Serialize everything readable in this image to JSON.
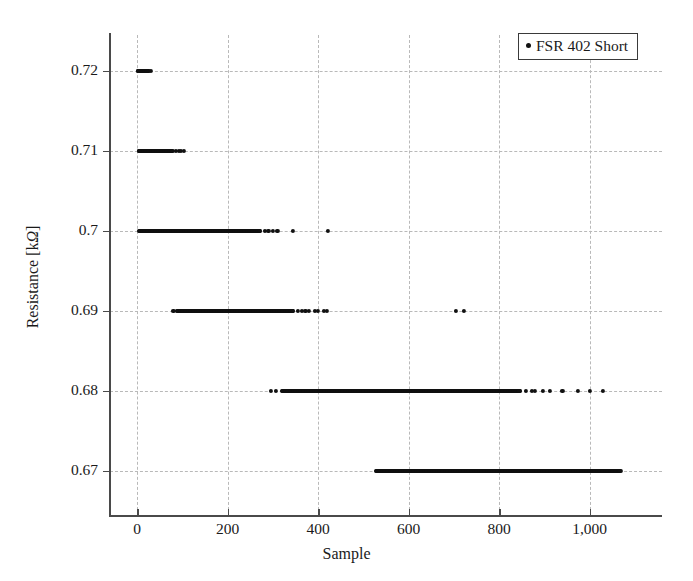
{
  "chart_data": {
    "type": "scatter",
    "title": "",
    "xlabel": "Sample",
    "ylabel": "Resistance [kΩ]",
    "ylabel_text": "Resistance [k",
    "ylabel_unit": "Ω",
    "ylabel_tail": "]",
    "xlim": [
      -60,
      1160
    ],
    "ylim": [
      0.6645,
      0.7245
    ],
    "grid": true,
    "legend_position": "top-right",
    "marker": "dot",
    "marker_color": "#111111",
    "xticks": [
      0,
      200,
      400,
      600,
      800,
      1000
    ],
    "xticklabels": [
      "0",
      "200",
      "400",
      "600",
      "800",
      "1,000"
    ],
    "yticks": [
      0.67,
      0.68,
      0.69,
      0.7,
      0.71,
      0.72
    ],
    "yticklabels": [
      "0.67",
      "0.68",
      "0.69",
      "0.7",
      "0.71",
      "0.72"
    ],
    "series": [
      {
        "name": "FSR 402 Short",
        "color": "#111111",
        "levels": [
          {
            "y": 0.72,
            "dense_ranges": [
              [
                2,
                26
              ]
            ],
            "points": [
              2,
              30
            ]
          },
          {
            "y": 0.71,
            "dense_ranges": [
              [
                3,
                78
              ]
            ],
            "points": [
              86,
              92,
              96,
              104
            ]
          },
          {
            "y": 0.7,
            "dense_ranges": [
              [
                4,
                272
              ]
            ],
            "points": [
              282,
              290,
              300,
              310,
              345,
              422
            ]
          },
          {
            "y": 0.69,
            "dense_ranges": [
              [
                88,
                345
              ]
            ],
            "points": [
              80,
              356,
              364,
              372,
              380,
              392,
              400,
              412,
              420,
              704,
              722
            ]
          },
          {
            "y": 0.68,
            "dense_ranges": [
              [
                320,
                845
              ]
            ],
            "points": [
              296,
              306,
              860,
              872,
              880,
              896,
              912,
              940,
              975,
              1000,
              1030
            ]
          },
          {
            "y": 0.67,
            "dense_ranges": [
              [
                528,
                1068
              ]
            ],
            "points": []
          }
        ]
      }
    ]
  },
  "legend": {
    "entries": [
      {
        "label": "FSR 402 Short",
        "marker": "dot-marker"
      }
    ]
  },
  "axes": {
    "x_title": "Sample",
    "y_title": "Resistance [kΩ]"
  }
}
